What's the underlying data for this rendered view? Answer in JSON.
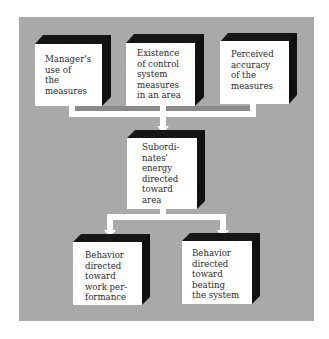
{
  "diagram": {
    "type": "flow-diagram",
    "colors": {
      "panel": "#a9a9a9",
      "box_face": "#ffffff",
      "box_bevel": "#141414",
      "connector": "#ffffff",
      "text": "#2a2a2a"
    },
    "inputs": [
      {
        "id": "managers-use",
        "lines": [
          "Manager's",
          "use of",
          "the",
          "measures"
        ]
      },
      {
        "id": "existence-of-control",
        "lines": [
          "Existence",
          "of control",
          "system",
          "measures",
          "in an area"
        ]
      },
      {
        "id": "perceived-accuracy",
        "lines": [
          "Perceived",
          "accuracy",
          "of the",
          "measures"
        ]
      }
    ],
    "middle": {
      "id": "subordinates-energy",
      "lines": [
        "Subordi-",
        "nates'",
        "energy",
        "directed",
        "toward",
        "area"
      ]
    },
    "outputs": [
      {
        "id": "behavior-work",
        "lines": [
          "Behavior",
          "directed",
          "toward",
          "work per-",
          "formance"
        ]
      },
      {
        "id": "behavior-beating",
        "lines": [
          "Behavior",
          "directed",
          "toward",
          "beating",
          "the system"
        ]
      }
    ],
    "edges": [
      [
        "managers-use",
        "subordinates-energy"
      ],
      [
        "existence-of-control",
        "subordinates-energy"
      ],
      [
        "perceived-accuracy",
        "subordinates-energy"
      ],
      [
        "subordinates-energy",
        "behavior-work"
      ],
      [
        "subordinates-energy",
        "behavior-beating"
      ]
    ]
  }
}
